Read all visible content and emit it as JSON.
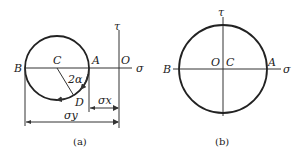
{
  "figure_a": {
    "caption": "(a)",
    "axis_labels": {
      "horizontal": "σ",
      "vertical": "τ"
    },
    "points": {
      "B": "B",
      "C": "C",
      "A": "A",
      "O": "O",
      "D": "D"
    },
    "angle_label": "2α",
    "dimensions": {
      "sigma_x": "σx",
      "sigma_y": "σy"
    }
  },
  "figure_b": {
    "caption": "(b)",
    "axis_labels": {
      "horizontal": "σ",
      "vertical": "τ"
    },
    "points": {
      "B": "B",
      "O": "O",
      "C": "C",
      "A": "A"
    }
  }
}
